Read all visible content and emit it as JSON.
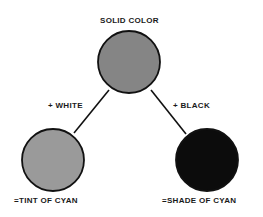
{
  "title": "SOLID COLOR",
  "branches": {
    "left": {
      "operation": "+ WHITE",
      "result": "=TINT OF CYAN",
      "fill": "#9a9a9a"
    },
    "right": {
      "operation": "+ BLACK",
      "result": "=SHADE OF CYAN",
      "fill": "#0c0c0c"
    }
  },
  "source": {
    "fill": "#858585"
  },
  "colors": {
    "stroke": "#111111",
    "text": "#1a1a1a",
    "background": "#ffffff"
  }
}
